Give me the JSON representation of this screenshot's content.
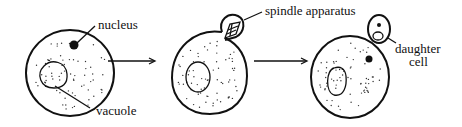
{
  "diagram": {
    "labels": {
      "nucleus": "nucleus",
      "vacuole": "vacuole",
      "spindle": "spindle apparatus",
      "daughter_line1": "daughter",
      "daughter_line2": "cell"
    },
    "stages": [
      {
        "name": "parent-cell"
      },
      {
        "name": "bud-forming-cell"
      },
      {
        "name": "daughter-cell-separating"
      }
    ],
    "colors": {
      "ink": "#111111",
      "background": "#ffffff"
    }
  }
}
